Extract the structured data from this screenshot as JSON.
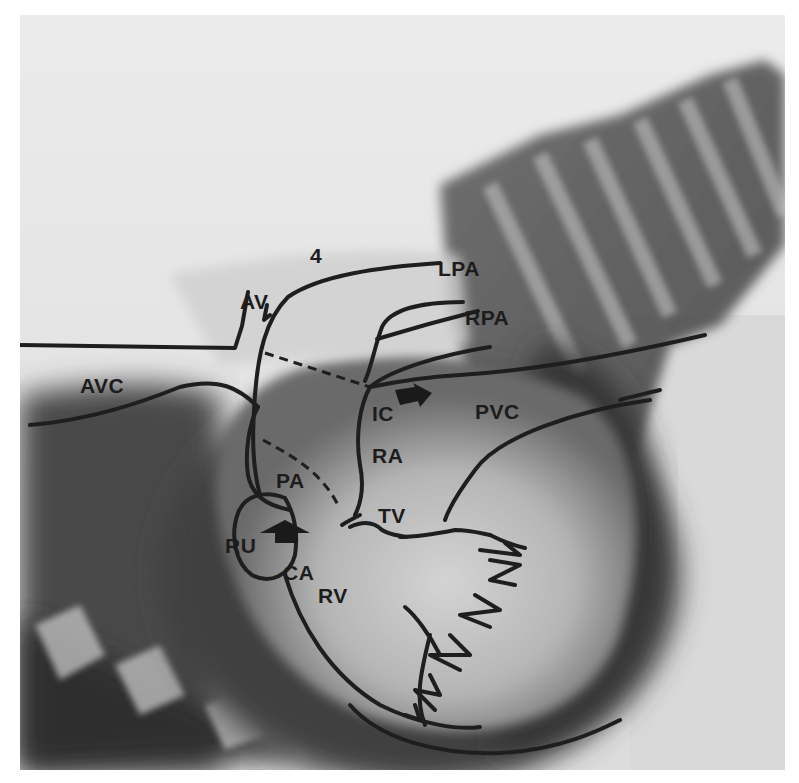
{
  "figure": {
    "type": "annotated-radiograph",
    "view": "lateral angiocardiogram",
    "labels": {
      "number": "4",
      "av": "AV",
      "lpa": "LPA",
      "rpa": "RPA",
      "avc": "AVC",
      "ic": "IC",
      "pvc": "PVC",
      "ra": "RA",
      "pa": "PA",
      "tv": "TV",
      "ru": "RU",
      "ca": "CA",
      "rv": "RV"
    },
    "arrows": [
      {
        "name": "arrow-near-ic",
        "direction": "right-down"
      },
      {
        "name": "arrow-near-ca",
        "direction": "up"
      }
    ],
    "colors": {
      "outline": "#1e1e1e",
      "background_light": "#e6e6e6",
      "background_dark": "#3a3a3a"
    }
  }
}
